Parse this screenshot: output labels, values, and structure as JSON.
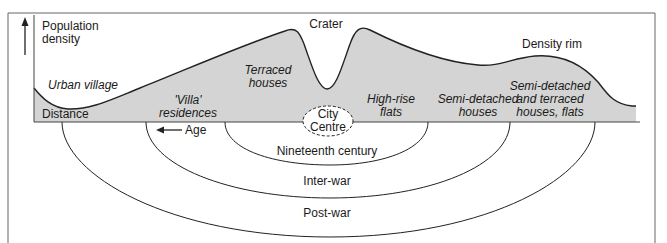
{
  "diagram": {
    "type": "urban population density profile with age zones",
    "colors": {
      "fill": "#d4d4d4",
      "line": "#222222",
      "frame": "#555555",
      "background": "#ffffff"
    },
    "axis": {
      "y_label_line1": "Population",
      "y_label_line2": "density",
      "x_label": "Distance"
    },
    "profile_labels": {
      "crater": "Crater",
      "density_rim": "Density rim"
    },
    "zones": [
      {
        "id": "urban-village",
        "line1": "Urban village",
        "line2": ""
      },
      {
        "id": "villa",
        "line1": "'Villa'",
        "line2": "residences"
      },
      {
        "id": "terraced",
        "line1": "Terraced",
        "line2": "houses"
      },
      {
        "id": "high-rise",
        "line1": "High-rise",
        "line2": "flats"
      },
      {
        "id": "semi-detached",
        "line1": "Semi-detached",
        "line2": "houses"
      },
      {
        "id": "mixed",
        "line1": "Semi-detached",
        "line2": "and terraced",
        "line3": "houses, flats"
      }
    ],
    "centre": {
      "line1": "City",
      "line2": "Centre"
    },
    "age_arrow": "Age",
    "rings": [
      {
        "id": "nineteenth",
        "label": "Nineteenth century"
      },
      {
        "id": "inter-war",
        "label": "Inter-war"
      },
      {
        "id": "post-war",
        "label": "Post-war"
      }
    ]
  }
}
